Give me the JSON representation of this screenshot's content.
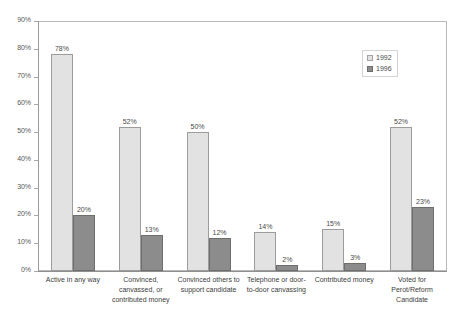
{
  "chart_data": {
    "type": "bar",
    "title": "",
    "subtitle": "",
    "xlabel": "",
    "ylabel": "",
    "ylim": [
      0,
      90
    ],
    "y_ticks": [
      "0%",
      "10%",
      "20%",
      "30%",
      "40%",
      "50%",
      "60%",
      "70%",
      "80%",
      "90%"
    ],
    "y_tick_values": [
      0,
      10,
      20,
      30,
      40,
      50,
      60,
      70,
      80,
      90
    ],
    "grid": false,
    "legend_position": "top-right",
    "categories": [
      "Active in any way",
      "Convinced, canvassed, or contributed money",
      "Convinced others to support candidate",
      "Telephone or door-to-door canvassing",
      "Contributed money",
      "Voted for Perot/Reform Candidate"
    ],
    "series": [
      {
        "name": "1992",
        "color": "#e2e2e2",
        "values": [
          78,
          52,
          50,
          14,
          15,
          52
        ],
        "labels": [
          "78%",
          "52%",
          "50%",
          "14%",
          "15%",
          "52%"
        ]
      },
      {
        "name": "1996",
        "color": "#8c8c8c",
        "values": [
          20,
          13,
          12,
          2,
          3,
          23
        ],
        "labels": [
          "20%",
          "13%",
          "12%",
          "2%",
          "3%",
          "23%"
        ]
      }
    ]
  },
  "legend": {
    "entries": [
      {
        "label": "1992",
        "swatch": "legend-swatch-1992"
      },
      {
        "label": "1996",
        "swatch": "legend-swatch-1996"
      }
    ]
  }
}
